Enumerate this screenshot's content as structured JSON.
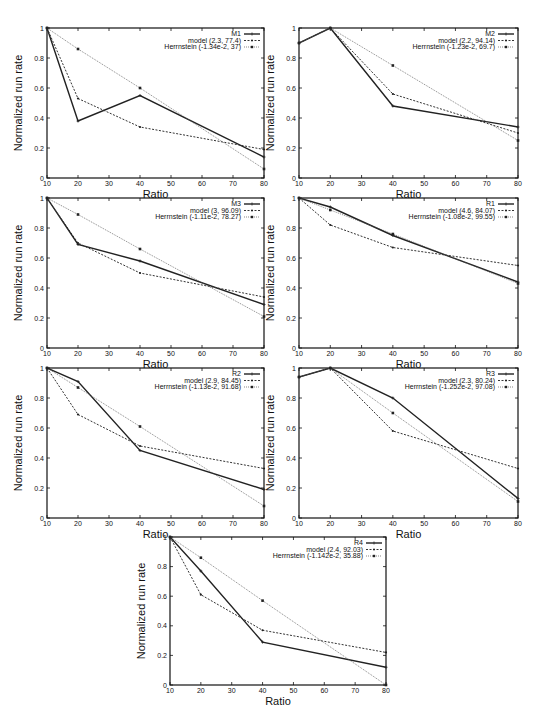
{
  "figure": {
    "xlabel": "Ratio",
    "ylabel": "Normalized run rate",
    "xticks": [
      10,
      20,
      30,
      40,
      50,
      60,
      70,
      80
    ],
    "yticks": [
      0,
      0.2,
      0.4,
      0.6,
      0.8,
      1
    ],
    "ytick_labels": [
      "0",
      "0.2",
      "0.4",
      "0.6",
      "0.8",
      "1"
    ],
    "line_color": "#222222"
  },
  "chart_data": [
    {
      "type": "line",
      "title": "M1",
      "xlabel": "Ratio",
      "ylabel": "Normalized run rate",
      "xlim": [
        10,
        80
      ],
      "ylim": [
        0,
        1
      ],
      "series": [
        {
          "name": "M1",
          "x": [
            10,
            20,
            40,
            80
          ],
          "values": [
            1.0,
            0.38,
            0.55,
            0.14
          ]
        },
        {
          "name": "model (2.3, 77.4)",
          "x": [
            10,
            20,
            40,
            80
          ],
          "values": [
            1.0,
            0.53,
            0.34,
            0.19
          ]
        },
        {
          "name": "Herrnstein (-1.34e-2, 37)",
          "x": [
            10,
            20,
            40,
            80
          ],
          "values": [
            1.0,
            0.86,
            0.6,
            0.06
          ]
        }
      ]
    },
    {
      "type": "line",
      "title": "M2",
      "xlabel": "Ratio",
      "ylabel": "Normalized run rate",
      "xlim": [
        10,
        80
      ],
      "ylim": [
        0,
        1
      ],
      "series": [
        {
          "name": "M2",
          "x": [
            10,
            20,
            40,
            80
          ],
          "values": [
            0.9,
            1.0,
            0.48,
            0.34
          ]
        },
        {
          "name": "model (2.2, 94.14)",
          "x": [
            10,
            20,
            40,
            80
          ],
          "values": [
            0.9,
            1.0,
            0.56,
            0.3
          ]
        },
        {
          "name": "Herrnstein (-1.23e-2, 69.7)",
          "x": [
            10,
            20,
            40,
            80
          ],
          "values": [
            0.9,
            1.0,
            0.75,
            0.25
          ]
        }
      ]
    },
    {
      "type": "line",
      "title": "M3",
      "xlabel": "Ratio",
      "ylabel": "Normalized run rate",
      "xlim": [
        10,
        80
      ],
      "ylim": [
        0,
        1
      ],
      "series": [
        {
          "name": "M3",
          "x": [
            10,
            20,
            40,
            80
          ],
          "values": [
            1.0,
            0.69,
            0.58,
            0.29
          ]
        },
        {
          "name": "model (3, 96.09)",
          "x": [
            10,
            20,
            40,
            80
          ],
          "values": [
            1.0,
            0.7,
            0.5,
            0.34
          ]
        },
        {
          "name": "Herrnstein (-1.11e-2, 78.27)",
          "x": [
            10,
            20,
            40,
            80
          ],
          "values": [
            1.0,
            0.89,
            0.66,
            0.21
          ]
        }
      ]
    },
    {
      "type": "line",
      "title": "R1",
      "xlabel": "Ratio",
      "ylabel": "Normalized run rate",
      "xlim": [
        10,
        80
      ],
      "ylim": [
        0,
        1
      ],
      "series": [
        {
          "name": "R1",
          "x": [
            10,
            20,
            40,
            80
          ],
          "values": [
            1.0,
            0.94,
            0.75,
            0.44
          ]
        },
        {
          "name": "model (4.6, 84.07)",
          "x": [
            10,
            20,
            40,
            80
          ],
          "values": [
            1.0,
            0.82,
            0.67,
            0.55
          ]
        },
        {
          "name": "Herrnstein (-1.08e-2, 99.55)",
          "x": [
            10,
            20,
            40,
            80
          ],
          "values": [
            1.0,
            0.92,
            0.76,
            0.43
          ]
        }
      ]
    },
    {
      "type": "line",
      "title": "R2",
      "xlabel": "Ratio",
      "ylabel": "Normalized run rate",
      "xlim": [
        10,
        80
      ],
      "ylim": [
        0,
        1
      ],
      "series": [
        {
          "name": "R2",
          "x": [
            10,
            20,
            40,
            80
          ],
          "values": [
            1.0,
            0.91,
            0.45,
            0.19
          ]
        },
        {
          "name": "model (2.9, 84.45)",
          "x": [
            10,
            20,
            40,
            80
          ],
          "values": [
            1.0,
            0.69,
            0.48,
            0.33
          ]
        },
        {
          "name": "Herrnstein (-1.13e-2, 91.68)",
          "x": [
            10,
            20,
            40,
            80
          ],
          "values": [
            1.0,
            0.87,
            0.61,
            0.08
          ]
        }
      ]
    },
    {
      "type": "line",
      "title": "R3",
      "xlabel": "Ratio",
      "ylabel": "Normalized run rate",
      "xlim": [
        10,
        80
      ],
      "ylim": [
        0,
        1
      ],
      "series": [
        {
          "name": "R3",
          "x": [
            10,
            20,
            40,
            80
          ],
          "values": [
            0.94,
            1.0,
            0.8,
            0.13
          ]
        },
        {
          "name": "model (2.3, 80.24)",
          "x": [
            10,
            20,
            40,
            80
          ],
          "values": [
            0.94,
            1.0,
            0.58,
            0.33
          ]
        },
        {
          "name": "Herrnstein (-1.252e-2, 97.08)",
          "x": [
            10,
            20,
            40,
            80
          ],
          "values": [
            0.94,
            1.0,
            0.7,
            0.11
          ]
        }
      ]
    },
    {
      "type": "line",
      "title": "R4",
      "xlabel": "Ratio",
      "ylabel": "Normalized run rate",
      "xlim": [
        10,
        80
      ],
      "ylim": [
        0,
        1
      ],
      "series": [
        {
          "name": "R4",
          "x": [
            10,
            20,
            40,
            80
          ],
          "values": [
            1.0,
            0.77,
            0.29,
            0.12
          ]
        },
        {
          "name": "model (2.4, 92.03)",
          "x": [
            10,
            20,
            40,
            80
          ],
          "values": [
            1.0,
            0.61,
            0.37,
            0.22
          ]
        },
        {
          "name": "Herrnstein (-1.142e-2, 35.88)",
          "x": [
            10,
            20,
            40,
            80
          ],
          "values": [
            1.0,
            0.86,
            0.57,
            0.0
          ]
        }
      ]
    }
  ]
}
